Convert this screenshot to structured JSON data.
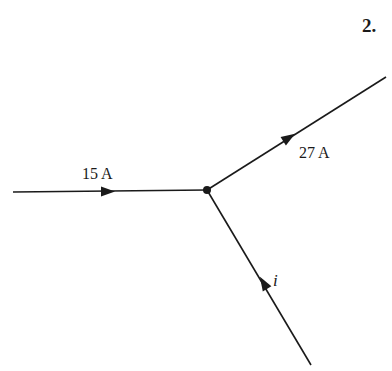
{
  "problem_number": "2.",
  "diagram": {
    "junction": {
      "x": 207,
      "y": 190
    },
    "branches": [
      {
        "id": "left",
        "label": "15 A",
        "direction": "into junction",
        "end": {
          "x": 13,
          "y": 192
        }
      },
      {
        "id": "upper-right",
        "label": "27 A",
        "direction": "out of junction",
        "end": {
          "x": 386,
          "y": 77
        }
      },
      {
        "id": "lower",
        "label": "i",
        "direction": "into junction",
        "end": {
          "x": 311,
          "y": 365
        }
      }
    ],
    "line_color": "#1a1a1a"
  }
}
